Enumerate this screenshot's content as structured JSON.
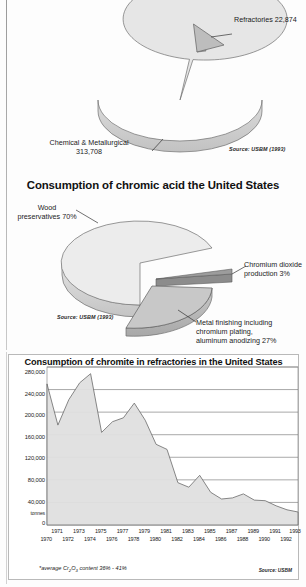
{
  "page": {
    "background": "#fdfdfd",
    "fill_light": "#e3e3e3",
    "fill_mid": "#c9c9c9",
    "fill_dark": "#a3a3a3",
    "stroke": "#6b6b6b"
  },
  "chart_data": [
    {
      "type": "pie",
      "id": "chromite-consumption-us",
      "title": "",
      "subtitle": "(tonnes)",
      "source": "Source: USBM (1993)",
      "units": "tonnes",
      "slices": [
        {
          "label": "Refractories 22,874",
          "name": "Refractories",
          "value": 22874,
          "percent": 6.8,
          "exploded": true,
          "color": "#bdbdbd"
        },
        {
          "label": "Chemical & Metallurgical\n313,708",
          "name": "Chemical & Metallurgical",
          "value": 313708,
          "percent": 93.2,
          "exploded": false,
          "color": "#e3e3e3"
        }
      ]
    },
    {
      "type": "pie",
      "id": "chromic-acid-consumption-us",
      "title": "Consumption of chromic acid the United States",
      "subtitle": "",
      "source": "Source: USBM (1993)",
      "units": "percent",
      "slices": [
        {
          "label": "Wood\npreservatives 70%",
          "name": "Wood preservatives",
          "value": 70,
          "percent": 70,
          "exploded": false,
          "color": "#e8e8e8"
        },
        {
          "label": "Chromium dioxide\nproduction 3%",
          "name": "Chromium dioxide production",
          "value": 3,
          "percent": 3,
          "exploded": true,
          "color": "#8f8f8f"
        },
        {
          "label": "Metal finishing including\nchromium plating,\naluminum anodizing 27%",
          "name": "Metal finishing including chromium plating, aluminum anodizing",
          "value": 27,
          "percent": 27,
          "exploded": true,
          "color": "#c6c6c6"
        }
      ]
    },
    {
      "type": "area",
      "id": "chromite-refractories-us",
      "title": "Consumption of chromite in refractories in the United States",
      "xlabel": "",
      "ylabel": "tonnes",
      "ylim": [
        0,
        280000
      ],
      "yticks": [
        "0",
        "40,000",
        "80,000",
        "120,000",
        "160,000",
        "200,000",
        "240,000",
        "280,000"
      ],
      "grid": true,
      "footnote": "*average Cr₂O₃ content 36% - 41%",
      "source": "Source: USBM",
      "x": [
        1970,
        1971,
        1972,
        1973,
        1974,
        1975,
        1976,
        1977,
        1978,
        1979,
        1980,
        1981,
        1982,
        1983,
        1984,
        1985,
        1986,
        1987,
        1988,
        1989,
        1990,
        1991,
        1992,
        1993
      ],
      "xticks_top": [
        "1971",
        "1973",
        "1975",
        "1977",
        "1979",
        "1981",
        "1983",
        "1985",
        "1987",
        "1989",
        "1991",
        "1993"
      ],
      "xticks_bottom": [
        "1970",
        "1972",
        "1974",
        "1976",
        "1978",
        "1980",
        "1982",
        "1984",
        "1986",
        "1988",
        "1990",
        "1992"
      ],
      "values": [
        250000,
        177000,
        222000,
        252000,
        268000,
        164000,
        183000,
        190000,
        216000,
        168000,
        143000,
        134000,
        75000,
        67000,
        88000,
        58000,
        46000,
        48000,
        55000,
        44000,
        43000,
        34000,
        27000,
        23000
      ]
    }
  ],
  "labels": {
    "subtitle_tonnes": "(tonnes)",
    "refractories": "Refractories 22,874",
    "chem_met": "Chemical & Metallurgical\n313,708",
    "source_usbm_1993": "Source: USBM (1993)",
    "title_chromic_acid": "Consumption of chromic acid the United States",
    "wood_pres": "Wood\npreservatives 70%",
    "chromium_dioxide": "Chromium dioxide\nproduction 3%",
    "metal_finishing": "Metal finishing including\nchromium plating,\naluminum anodizing 27%",
    "title_refractories": "Consumption of chromite in refractories in the United States",
    "tonnes_axis": "tonnes",
    "footnote": "*average Cr2O3 content 36% - 41%",
    "source_usbm": "Source: USBM"
  }
}
